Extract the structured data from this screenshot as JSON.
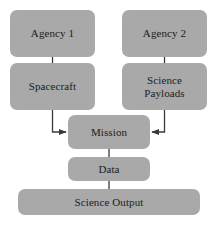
{
  "diagram": {
    "type": "flowchart",
    "title": "",
    "canvas": {
      "width": 218,
      "height": 233,
      "background": "#ffffff"
    },
    "style": {
      "node_fill": "#a9a9a9",
      "node_text_color": "#1c1c1c",
      "edge_color": "#3a3a3a"
    },
    "nodes": [
      {
        "id": "agency1",
        "label": "Agency 1"
      },
      {
        "id": "agency2",
        "label": "Agency 2"
      },
      {
        "id": "spacecraft",
        "label": "Spacecraft"
      },
      {
        "id": "payloads",
        "label": "Science\nPayloads"
      },
      {
        "id": "mission",
        "label": "Mission"
      },
      {
        "id": "data",
        "label": "Data"
      },
      {
        "id": "output",
        "label": "Science Output"
      }
    ],
    "edges": [
      {
        "from": "agency1",
        "to": "spacecraft",
        "kind": "line",
        "arrow": false
      },
      {
        "from": "agency2",
        "to": "payloads",
        "kind": "line",
        "arrow": false
      },
      {
        "from": "spacecraft",
        "to": "mission",
        "kind": "elbow",
        "arrow": true
      },
      {
        "from": "payloads",
        "to": "mission",
        "kind": "elbow",
        "arrow": true
      },
      {
        "from": "mission",
        "to": "data",
        "kind": "line",
        "arrow": false
      },
      {
        "from": "data",
        "to": "output",
        "kind": "line",
        "arrow": false
      }
    ]
  }
}
